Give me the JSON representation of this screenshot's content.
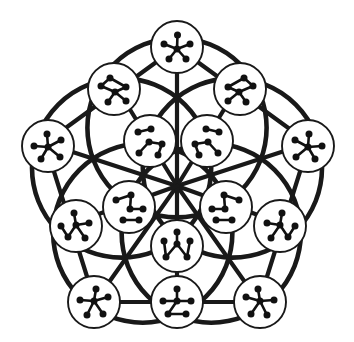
{
  "figure": {
    "canvas": {
      "width": 354,
      "height": 342
    },
    "colors": {
      "background": "#ffffff",
      "ink": "#191919",
      "vertex": "#111111",
      "disc_fill": "#ffffff"
    },
    "counts": {
      "nodes": 16,
      "outer_nodes": 5,
      "mid_nodes": 5,
      "inner_nodes": 5,
      "center_nodes": 1
    }
  },
  "skeleton": {
    "center": {
      "x": 177,
      "y": 186
    },
    "pentagon_outer": [
      {
        "x": 177,
        "y": 47
      },
      {
        "x": 309,
        "y": 143
      },
      {
        "x": 259,
        "y": 302
      },
      {
        "x": 95,
        "y": 302
      },
      {
        "x": 45,
        "y": 143
      }
    ],
    "pentagon_mid": [
      {
        "x": 118,
        "y": 90
      },
      {
        "x": 236,
        "y": 90
      },
      {
        "x": 286,
        "y": 225
      },
      {
        "x": 177,
        "y": 302
      },
      {
        "x": 68,
        "y": 225
      }
    ],
    "spoke_ends": [
      {
        "x": 177,
        "y": 47
      },
      {
        "x": 286,
        "y": 132
      },
      {
        "x": 244,
        "y": 260
      },
      {
        "x": 110,
        "y": 260
      },
      {
        "x": 68,
        "y": 132
      }
    ],
    "arc_radius": 112,
    "arc_count": 5
  },
  "nodes": [
    {
      "id": "node-top",
      "ring": "outer",
      "position": {
        "x": 177,
        "y": 47
      },
      "radius": 26,
      "graph_label": "star-5-spokes",
      "graph": {
        "vertices": [
          {
            "x": 0,
            "y": 2
          },
          {
            "x": 0.5,
            "y": -12
          },
          {
            "x": 13,
            "y": -3
          },
          {
            "x": 9,
            "y": 12
          },
          {
            "x": -8,
            "y": 12
          },
          {
            "x": -13,
            "y": -3
          }
        ],
        "edges": [
          [
            0,
            1
          ],
          [
            0,
            2
          ],
          [
            0,
            3
          ],
          [
            0,
            4
          ],
          [
            0,
            5
          ]
        ]
      }
    },
    {
      "id": "node-upper-left",
      "ring": "outer",
      "position": {
        "x": 114,
        "y": 89
      },
      "radius": 26,
      "graph_label": "star-4-with-pendant",
      "graph": {
        "vertices": [
          {
            "x": 1,
            "y": 3
          },
          {
            "x": -13,
            "y": -3
          },
          {
            "x": -4,
            "y": -11
          },
          {
            "x": 12,
            "y": -2
          },
          {
            "x": 12,
            "y": 12
          },
          {
            "x": -6,
            "y": 13
          }
        ],
        "edges": [
          [
            0,
            3
          ],
          [
            0,
            4
          ],
          [
            0,
            5
          ],
          [
            0,
            1
          ],
          [
            1,
            2
          ],
          [
            2,
            3
          ]
        ]
      }
    },
    {
      "id": "node-upper-right",
      "ring": "outer",
      "position": {
        "x": 240,
        "y": 89
      },
      "radius": 26,
      "graph_label": "star-4-with-pendant-mirror",
      "graph": {
        "vertices": [
          {
            "x": -1,
            "y": 3
          },
          {
            "x": 13,
            "y": -3
          },
          {
            "x": 4,
            "y": -11
          },
          {
            "x": -12,
            "y": -2
          },
          {
            "x": -12,
            "y": 12
          },
          {
            "x": 6,
            "y": 13
          }
        ],
        "edges": [
          [
            0,
            3
          ],
          [
            0,
            4
          ],
          [
            0,
            5
          ],
          [
            0,
            1
          ],
          [
            1,
            2
          ],
          [
            2,
            3
          ]
        ]
      }
    },
    {
      "id": "node-left",
      "ring": "outer",
      "position": {
        "x": 48,
        "y": 146
      },
      "radius": 26,
      "graph_label": "star-5-spokes",
      "graph": {
        "vertices": [
          {
            "x": 0,
            "y": 1
          },
          {
            "x": -1,
            "y": -12
          },
          {
            "x": 13,
            "y": -6
          },
          {
            "x": 12,
            "y": 11
          },
          {
            "x": -7,
            "y": 13
          },
          {
            "x": -14,
            "y": 0
          }
        ],
        "edges": [
          [
            0,
            1
          ],
          [
            0,
            2
          ],
          [
            0,
            3
          ],
          [
            0,
            4
          ],
          [
            0,
            5
          ]
        ]
      }
    },
    {
      "id": "node-right",
      "ring": "outer",
      "position": {
        "x": 308,
        "y": 146
      },
      "radius": 26,
      "graph_label": "star-5-spokes",
      "graph": {
        "vertices": [
          {
            "x": 0,
            "y": 1
          },
          {
            "x": 1,
            "y": -12
          },
          {
            "x": -13,
            "y": -6
          },
          {
            "x": -12,
            "y": 11
          },
          {
            "x": 7,
            "y": 13
          },
          {
            "x": 14,
            "y": 0
          }
        ],
        "edges": [
          [
            0,
            1
          ],
          [
            0,
            2
          ],
          [
            0,
            3
          ],
          [
            0,
            4
          ],
          [
            0,
            5
          ]
        ]
      }
    },
    {
      "id": "node-bottom-left-outer",
      "ring": "outer",
      "position": {
        "x": 94,
        "y": 302
      },
      "radius": 26,
      "graph_label": "star-5-spokes",
      "graph": {
        "vertices": [
          {
            "x": 0,
            "y": -1
          },
          {
            "x": 2,
            "y": -13
          },
          {
            "x": 14,
            "y": -5
          },
          {
            "x": 9,
            "y": 12
          },
          {
            "x": -7,
            "y": 13
          },
          {
            "x": -14,
            "y": -2
          }
        ],
        "edges": [
          [
            0,
            1
          ],
          [
            0,
            2
          ],
          [
            0,
            3
          ],
          [
            0,
            4
          ],
          [
            0,
            5
          ]
        ]
      }
    },
    {
      "id": "node-bottom-right-outer",
      "ring": "outer",
      "position": {
        "x": 260,
        "y": 302
      },
      "radius": 26,
      "graph_label": "star-5-spokes",
      "graph": {
        "vertices": [
          {
            "x": 0,
            "y": -1
          },
          {
            "x": -2,
            "y": -13
          },
          {
            "x": -14,
            "y": -5
          },
          {
            "x": -9,
            "y": 12
          },
          {
            "x": 7,
            "y": 13
          },
          {
            "x": 14,
            "y": -2
          }
        ],
        "edges": [
          [
            0,
            1
          ],
          [
            0,
            2
          ],
          [
            0,
            3
          ],
          [
            0,
            4
          ],
          [
            0,
            5
          ]
        ]
      }
    },
    {
      "id": "node-mid-left",
      "ring": "mid",
      "position": {
        "x": 76,
        "y": 226
      },
      "radius": 26,
      "graph_label": "star-4-with-pendant",
      "graph": {
        "vertices": [
          {
            "x": 0,
            "y": -1
          },
          {
            "x": -2,
            "y": -13
          },
          {
            "x": 13,
            "y": -3
          },
          {
            "x": 9,
            "y": 12
          },
          {
            "x": -8,
            "y": 11
          },
          {
            "x": -15,
            "y": 0
          }
        ],
        "edges": [
          [
            0,
            1
          ],
          [
            0,
            2
          ],
          [
            0,
            3
          ],
          [
            0,
            4
          ],
          [
            4,
            5
          ]
        ]
      }
    },
    {
      "id": "node-mid-right",
      "ring": "mid",
      "position": {
        "x": 280,
        "y": 226
      },
      "radius": 26,
      "graph_label": "star-4-with-pendant-mirror",
      "graph": {
        "vertices": [
          {
            "x": 0,
            "y": -1
          },
          {
            "x": 2,
            "y": -13
          },
          {
            "x": -13,
            "y": -3
          },
          {
            "x": -9,
            "y": 12
          },
          {
            "x": 8,
            "y": 11
          },
          {
            "x": 15,
            "y": 0
          }
        ],
        "edges": [
          [
            0,
            1
          ],
          [
            0,
            2
          ],
          [
            0,
            3
          ],
          [
            0,
            4
          ],
          [
            4,
            5
          ]
        ]
      }
    },
    {
      "id": "node-bottom-mid",
      "ring": "mid",
      "position": {
        "x": 177,
        "y": 302
      },
      "radius": 26,
      "graph_label": "star-4-with-leaf-edge",
      "graph": {
        "vertices": [
          {
            "x": 0,
            "y": -1
          },
          {
            "x": 0,
            "y": -13
          },
          {
            "x": 14,
            "y": -1
          },
          {
            "x": 9,
            "y": 12
          },
          {
            "x": -9,
            "y": 12
          },
          {
            "x": -14,
            "y": -1
          }
        ],
        "edges": [
          [
            0,
            1
          ],
          [
            0,
            2
          ],
          [
            0,
            4
          ],
          [
            0,
            5
          ],
          [
            3,
            4
          ]
        ]
      }
    },
    {
      "id": "node-inner-upper-left",
      "ring": "inner",
      "position": {
        "x": 150,
        "y": 141
      },
      "radius": 26,
      "graph_label": "path-and-pair",
      "graph": {
        "vertices": [
          {
            "x": -12,
            "y": -9
          },
          {
            "x": 1,
            "y": -12
          },
          {
            "x": -1,
            "y": 1
          },
          {
            "x": 12,
            "y": 3
          },
          {
            "x": -11,
            "y": 12
          },
          {
            "x": 8,
            "y": 14
          }
        ],
        "edges": [
          [
            0,
            1
          ],
          [
            2,
            3
          ],
          [
            2,
            4
          ],
          [
            3,
            5
          ]
        ]
      }
    },
    {
      "id": "node-inner-upper-right",
      "ring": "inner",
      "position": {
        "x": 207,
        "y": 141
      },
      "radius": 26,
      "graph_label": "path-and-pair-mirror",
      "graph": {
        "vertices": [
          {
            "x": 12,
            "y": -9
          },
          {
            "x": -1,
            "y": -12
          },
          {
            "x": 1,
            "y": 1
          },
          {
            "x": -12,
            "y": 3
          },
          {
            "x": 11,
            "y": 12
          },
          {
            "x": -8,
            "y": 14
          }
        ],
        "edges": [
          [
            0,
            1
          ],
          [
            2,
            3
          ],
          [
            2,
            4
          ],
          [
            3,
            5
          ]
        ]
      }
    },
    {
      "id": "node-inner-left",
      "ring": "inner",
      "position": {
        "x": 129,
        "y": 207
      },
      "radius": 26,
      "graph_label": "tree-with-bar",
      "graph": {
        "vertices": [
          {
            "x": -13,
            "y": -7
          },
          {
            "x": 2,
            "y": -12
          },
          {
            "x": 1,
            "y": 2
          },
          {
            "x": 14,
            "y": 2
          },
          {
            "x": -6,
            "y": 13
          },
          {
            "x": 10,
            "y": 13
          }
        ],
        "edges": [
          [
            0,
            1
          ],
          [
            1,
            2
          ],
          [
            2,
            3
          ],
          [
            4,
            5
          ]
        ]
      }
    },
    {
      "id": "node-inner-right",
      "ring": "inner",
      "position": {
        "x": 226,
        "y": 207
      },
      "radius": 26,
      "graph_label": "tree-with-bar-mirror",
      "graph": {
        "vertices": [
          {
            "x": 13,
            "y": -7
          },
          {
            "x": -2,
            "y": -12
          },
          {
            "x": -1,
            "y": 2
          },
          {
            "x": -14,
            "y": 2
          },
          {
            "x": 6,
            "y": 13
          },
          {
            "x": -10,
            "y": 13
          }
        ],
        "edges": [
          [
            0,
            1
          ],
          [
            1,
            2
          ],
          [
            2,
            3
          ],
          [
            4,
            5
          ]
        ]
      }
    },
    {
      "id": "node-inner-bottom",
      "ring": "inner",
      "position": {
        "x": 177,
        "y": 246
      },
      "radius": 26,
      "graph_label": "three-pendant-claw",
      "graph": {
        "vertices": [
          {
            "x": 0,
            "y": -2
          },
          {
            "x": 0,
            "y": -14
          },
          {
            "x": 13,
            "y": -5
          },
          {
            "x": 10,
            "y": 11
          },
          {
            "x": -11,
            "y": 11
          },
          {
            "x": -13,
            "y": -5
          }
        ],
        "edges": [
          [
            0,
            1
          ],
          [
            2,
            3
          ],
          [
            4,
            5
          ],
          [
            0,
            3
          ],
          [
            0,
            4
          ]
        ]
      }
    },
    {
      "id": "node-center",
      "ring": "center",
      "position": {
        "x": 177,
        "y": 186
      },
      "radius": 0,
      "graph_label": "hub-intersection",
      "graph": {
        "vertices": [],
        "edges": []
      }
    }
  ]
}
